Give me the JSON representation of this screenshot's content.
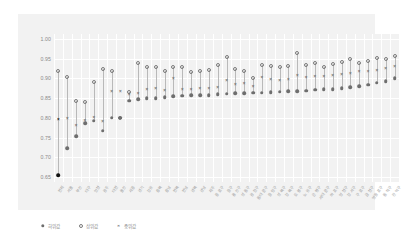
{
  "chart_data": {
    "type": "scatter",
    "title": "",
    "subtitle": "",
    "xlabel": "",
    "ylabel": "",
    "ylim": [
      0.6375,
      1.0125
    ],
    "yticks": [
      "0.65",
      "0.70",
      "0.75",
      "0.80",
      "0.85",
      "0.90",
      "0.95",
      "1.00"
    ],
    "ytick_values": [
      0.65,
      0.7,
      0.75,
      0.8,
      0.85,
      0.9,
      0.95,
      1.0
    ],
    "grid": "horizontal-and-vertical",
    "legend_position": "bottom-left",
    "categories": [
      "전체",
      "서울",
      "부산",
      "대구",
      "인천",
      "광주",
      "대전",
      "울산",
      "세종",
      "경기",
      "강원",
      "충북",
      "충남",
      "전북",
      "전남",
      "경북",
      "경남",
      "제주",
      "종로구",
      "중구",
      "용산구",
      "성동구",
      "광진구",
      "동대문구",
      "중랑구",
      "성북구",
      "강북구",
      "도봉구",
      "노원구",
      "은평구",
      "서대문구",
      "마포구",
      "양천구",
      "강서구",
      "구로구",
      "금천구",
      "영등포구",
      "동작구",
      "관악구"
    ],
    "series": [
      {
        "name": "하위값",
        "marker": "filled-circle",
        "color": "#6e6e6e",
        "values": [
          0.655,
          0.723,
          0.753,
          0.787,
          0.793,
          0.767,
          0.8,
          0.8,
          0.843,
          0.847,
          0.85,
          0.85,
          0.853,
          0.855,
          0.856,
          0.857,
          0.858,
          0.858,
          0.86,
          0.861,
          0.862,
          0.863,
          0.864,
          0.864,
          0.865,
          0.866,
          0.867,
          0.868,
          0.869,
          0.871,
          0.872,
          0.873,
          0.875,
          0.877,
          0.88,
          0.884,
          0.889,
          0.893,
          0.9
        ]
      },
      {
        "name": "상위값",
        "marker": "open-circle",
        "color": "#7a7a7a",
        "values": [
          0.92,
          0.903,
          0.842,
          0.84,
          0.89,
          0.925,
          0.92,
          0.8,
          0.866,
          0.94,
          0.928,
          0.93,
          0.92,
          0.93,
          0.93,
          0.916,
          0.919,
          0.921,
          0.933,
          0.955,
          0.925,
          0.92,
          0.9,
          0.934,
          0.931,
          0.93,
          0.932,
          0.965,
          0.935,
          0.938,
          0.93,
          0.936,
          0.942,
          0.948,
          0.94,
          0.944,
          0.952,
          0.95,
          0.958
        ]
      },
      {
        "name": "중위값",
        "marker": "x",
        "color": "#707070",
        "values": [
          0.795,
          0.797,
          0.78,
          0.793,
          0.8,
          0.79,
          0.865,
          0.866,
          0.857,
          0.86,
          0.87,
          0.872,
          0.867,
          0.898,
          0.87,
          0.871,
          0.873,
          0.874,
          0.876,
          0.893,
          0.883,
          0.885,
          0.879,
          0.9,
          0.896,
          0.893,
          0.897,
          0.905,
          0.901,
          0.904,
          0.903,
          0.907,
          0.909,
          0.912,
          0.915,
          0.917,
          0.92,
          0.924,
          0.93
        ]
      }
    ]
  },
  "legend": {
    "items": [
      {
        "label": "하위값",
        "marker": "filled-circle"
      },
      {
        "label": "상위값",
        "marker": "open-circle"
      },
      {
        "label": "중위값",
        "marker": "x"
      }
    ]
  },
  "colors": {
    "panel_background": "#f2f2f2",
    "plot_background": "#f2f2f2",
    "gridline": "#ffffff",
    "tick_text": "#8a8a8a",
    "label_text": "#9a9a9a",
    "stem": "#b9b9b9",
    "first_column_highlight": "#111111"
  }
}
